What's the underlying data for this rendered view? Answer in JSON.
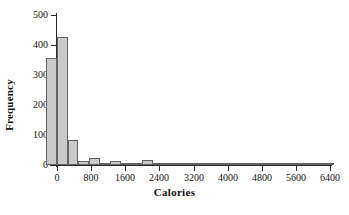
{
  "chart_data": {
    "type": "bar",
    "title": "",
    "subtitle": "",
    "xlabel": "Calories",
    "ylabel": "Frequency",
    "xlim": [
      -250,
      6500
    ],
    "ylim": [
      0,
      500
    ],
    "grid": false,
    "legend": null,
    "bin_width": 250,
    "xticks": [
      0,
      800,
      1600,
      2400,
      3200,
      4000,
      4800,
      5600,
      6400
    ],
    "xtick_labels": [
      "0",
      "800",
      "1600",
      "2400",
      "3200",
      "4000",
      "4800",
      "5600",
      "6400"
    ],
    "yticks": [
      0,
      100,
      200,
      300,
      400,
      500
    ],
    "ytick_labels": [
      "0",
      "100",
      "200",
      "300",
      "400",
      "500"
    ],
    "bars": [
      {
        "bin_start": -250,
        "bin_end": 0,
        "value": 357
      },
      {
        "bin_start": 0,
        "bin_end": 250,
        "value": 428
      },
      {
        "bin_start": 250,
        "bin_end": 500,
        "value": 85
      },
      {
        "bin_start": 500,
        "bin_end": 750,
        "value": 12
      },
      {
        "bin_start": 750,
        "bin_end": 1000,
        "value": 22
      },
      {
        "bin_start": 1000,
        "bin_end": 1250,
        "value": 3
      },
      {
        "bin_start": 1250,
        "bin_end": 1500,
        "value": 15
      },
      {
        "bin_start": 1500,
        "bin_end": 1750,
        "value": 8
      },
      {
        "bin_start": 1750,
        "bin_end": 2000,
        "value": 3
      },
      {
        "bin_start": 2000,
        "bin_end": 2250,
        "value": 16
      },
      {
        "bin_start": 2250,
        "bin_end": 2500,
        "value": 7
      },
      {
        "bin_start": 2500,
        "bin_end": 2750,
        "value": 3
      },
      {
        "bin_start": 2750,
        "bin_end": 3000,
        "value": 2
      },
      {
        "bin_start": 3000,
        "bin_end": 3250,
        "value": 3
      },
      {
        "bin_start": 3250,
        "bin_end": 3500,
        "value": 2
      },
      {
        "bin_start": 3500,
        "bin_end": 3750,
        "value": 3
      },
      {
        "bin_start": 3750,
        "bin_end": 4000,
        "value": 5
      },
      {
        "bin_start": 4000,
        "bin_end": 4250,
        "value": 4
      },
      {
        "bin_start": 4250,
        "bin_end": 4500,
        "value": 2
      },
      {
        "bin_start": 4500,
        "bin_end": 4750,
        "value": 2
      },
      {
        "bin_start": 4750,
        "bin_end": 5000,
        "value": 3
      },
      {
        "bin_start": 5000,
        "bin_end": 5250,
        "value": 5
      },
      {
        "bin_start": 5250,
        "bin_end": 5500,
        "value": 3
      },
      {
        "bin_start": 5500,
        "bin_end": 5750,
        "value": 2
      },
      {
        "bin_start": 5750,
        "bin_end": 6000,
        "value": 2
      },
      {
        "bin_start": 6000,
        "bin_end": 6250,
        "value": 6
      },
      {
        "bin_start": 6250,
        "bin_end": 6500,
        "value": 3
      }
    ],
    "colors": {
      "bar_fill": "#c9c9c9",
      "bar_edge": "#636363",
      "axis": "#2a2a2a",
      "text": "#141414",
      "background": "#ffffff"
    }
  }
}
